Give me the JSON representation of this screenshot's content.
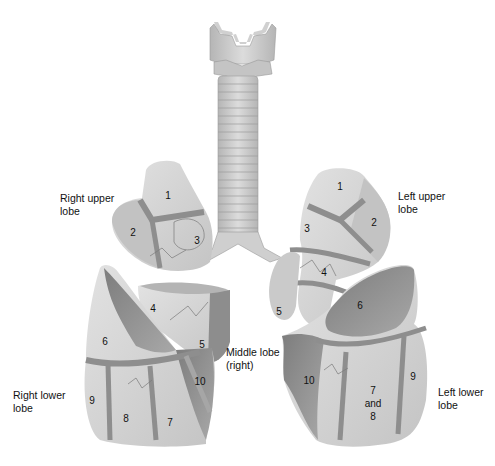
{
  "diagram": {
    "colors": {
      "light_tissue": "#d9d9d9",
      "mid_tissue": "#bdbdbd",
      "dark_tissue": "#8a8a8a",
      "fissure_band": "#8f8f8f",
      "trachea": "#c8c8c8",
      "text": "#111111"
    },
    "lobe_labels": {
      "right_upper": [
        "Right upper",
        "lobe"
      ],
      "left_upper": [
        "Left upper",
        "lobe"
      ],
      "middle": [
        "Middle lobe",
        "(right)"
      ],
      "right_lower": [
        "Right lower",
        "lobe"
      ],
      "left_lower": [
        "Left lower",
        "lobe"
      ]
    },
    "segments": {
      "right_upper": [
        "1",
        "2",
        "3"
      ],
      "right_middle": [
        "4",
        "5"
      ],
      "right_lower": [
        "6",
        "7",
        "8",
        "9",
        "10"
      ],
      "left_upper": [
        "1",
        "2",
        "3",
        "4",
        "5"
      ],
      "left_lower": [
        "6",
        "7",
        "and",
        "8",
        "9",
        "10"
      ]
    }
  }
}
